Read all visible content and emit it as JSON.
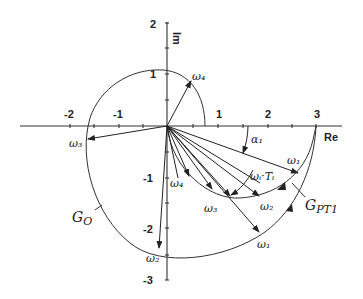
{
  "diagram": {
    "type": "nyquist-locus",
    "axes": {
      "x_label": "Re",
      "y_label": "Im",
      "x_ticks": [
        "-2",
        "-1",
        "1",
        "2",
        "3"
      ],
      "y_ticks": [
        "2",
        "1",
        "-1",
        "-2",
        "-3"
      ]
    },
    "curves": [
      {
        "name": "G_o",
        "label_main": "G",
        "label_sub": "O"
      },
      {
        "name": "G_PT1",
        "label_main": "G",
        "label_sub": "PT1"
      }
    ],
    "labels": {
      "omega4_top": "ω₄",
      "omega3_left": "ω₃",
      "omega2_bottom": "ω₂",
      "omega1_bottom": "ω₁",
      "omega4_inner": "ω₄",
      "omega3_inner": "ω₃",
      "omega2_inner": "ω₂",
      "omega1_ray": "ω₁",
      "omega_i_Tt": "ωᵢ·Tₜ",
      "alpha1": "α₁"
    }
  }
}
